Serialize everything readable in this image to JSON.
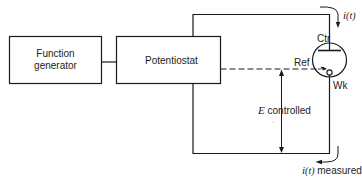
{
  "diagram": {
    "blocks": {
      "function_generator": {
        "line1": "Function",
        "line2": "generator"
      },
      "potentiostat": {
        "label": "Potentiostat"
      }
    },
    "cell": {
      "counter_electrode": "Ctr",
      "reference_electrode": "Ref",
      "working_electrode": "Wk"
    },
    "annotations": {
      "current_top_var": "i",
      "current_top_arg": "(t)",
      "potential_symbol": "E",
      "potential_text": " controlled",
      "current_bottom_var": "i",
      "current_bottom_arg": "(t)",
      "current_bottom_text": " measured"
    },
    "colors": {
      "line": "#1a1a1a",
      "background": "#ffffff"
    }
  }
}
